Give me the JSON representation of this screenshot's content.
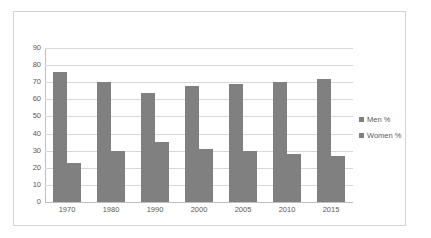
{
  "chart_data": {
    "type": "bar",
    "title": "",
    "subtitle": "",
    "xlabel": "",
    "ylabel": "",
    "categories": [
      "1970",
      "1980",
      "1990",
      "2000",
      "2005",
      "2010",
      "2015"
    ],
    "series": [
      {
        "name": "Men %",
        "values": [
          76,
          70,
          64,
          68,
          69,
          70,
          72
        ],
        "color": "#808080"
      },
      {
        "name": "Women %",
        "values": [
          23,
          30,
          35,
          31,
          30,
          28,
          27
        ],
        "color": "#808080"
      }
    ],
    "ylim": [
      0,
      90
    ],
    "ytick_step": 10,
    "yticks": [
      "90",
      "80",
      "70",
      "60",
      "50",
      "40",
      "30",
      "20",
      "10",
      "0"
    ],
    "grid": "horizontal",
    "legend_position": "right",
    "plot_background": "#ffffff",
    "gridline_color": "#d9d9d9",
    "axis_color": "#bfbfbf",
    "tick_label_color": "#595959",
    "frame_border_color": "#d4d4d4"
  }
}
